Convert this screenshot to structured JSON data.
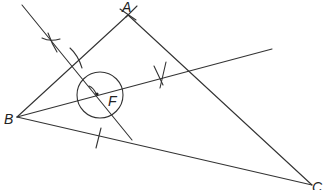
{
  "diagram": {
    "type": "geometric-construction",
    "stroke_color": "#333333",
    "background": "#ffffff",
    "points": {
      "A": {
        "label": "A",
        "x": 128,
        "y": 15
      },
      "B": {
        "label": "B",
        "x": 17,
        "y": 117
      },
      "C": {
        "label": "C",
        "x": 312,
        "y": 185
      },
      "F": {
        "label": "F",
        "x": 98,
        "y": 94
      }
    },
    "labels": {
      "A": "A",
      "B": "B",
      "C": "C",
      "F": "F"
    },
    "triangle": [
      "A",
      "B",
      "C"
    ],
    "circle": {
      "center": "F",
      "cx": 100,
      "cy": 95,
      "r": 23
    },
    "construction_lines": [
      {
        "name": "perpendicular-through-F",
        "from": [
          22,
          5
        ],
        "to": [
          132,
          140
        ]
      },
      {
        "name": "angle-bisector-from-B",
        "from": [
          17,
          117
        ],
        "to": [
          272,
          49
        ]
      }
    ]
  }
}
